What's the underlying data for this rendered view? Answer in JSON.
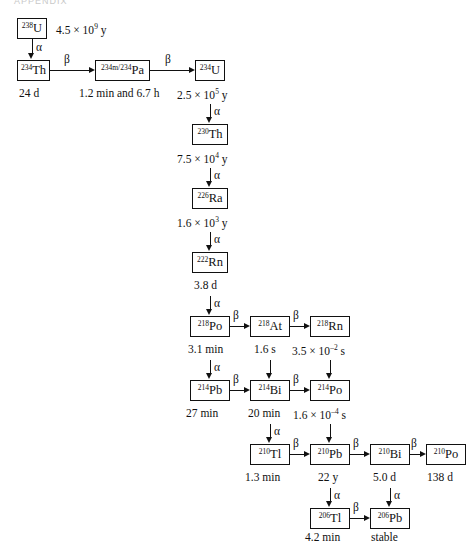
{
  "figure": {
    "title_fragment": "APPENDIX",
    "alpha_label": "α",
    "beta_label": "β"
  },
  "nuclides": [
    {
      "id": "u238",
      "mass": "238",
      "symbol": "U",
      "halflife": "4.5 × 10",
      "halflife_exp": "9",
      "halflife_unit": " y"
    },
    {
      "id": "th234",
      "mass": "234",
      "symbol": "Th",
      "halflife": "24 d",
      "halflife_exp": "",
      "halflife_unit": ""
    },
    {
      "id": "pa234",
      "mass": "234m/234",
      "symbol": "Pa",
      "halflife": "1.2 min and 6.7 h",
      "halflife_exp": "",
      "halflife_unit": ""
    },
    {
      "id": "u234",
      "mass": "234",
      "symbol": "U",
      "halflife": "2.5 × 10",
      "halflife_exp": "5",
      "halflife_unit": " y"
    },
    {
      "id": "th230",
      "mass": "230",
      "symbol": "Th",
      "halflife": "7.5 × 10",
      "halflife_exp": "4",
      "halflife_unit": " y"
    },
    {
      "id": "ra226",
      "mass": "226",
      "symbol": "Ra",
      "halflife": "1.6 × 10",
      "halflife_exp": "3",
      "halflife_unit": " y"
    },
    {
      "id": "rn222",
      "mass": "222",
      "symbol": "Rn",
      "halflife": "3.8 d",
      "halflife_exp": "",
      "halflife_unit": ""
    },
    {
      "id": "po218",
      "mass": "218",
      "symbol": "Po",
      "halflife": "3.1 min",
      "halflife_exp": "",
      "halflife_unit": ""
    },
    {
      "id": "at218",
      "mass": "218",
      "symbol": "At",
      "halflife": "1.6 s",
      "halflife_exp": "",
      "halflife_unit": ""
    },
    {
      "id": "rn218",
      "mass": "218",
      "symbol": "Rn",
      "halflife": "3.5 × 10",
      "halflife_exp": "–2",
      "halflife_unit": " s"
    },
    {
      "id": "pb214",
      "mass": "214",
      "symbol": "Pb",
      "halflife": "27 min",
      "halflife_exp": "",
      "halflife_unit": ""
    },
    {
      "id": "bi214",
      "mass": "214",
      "symbol": "Bi",
      "halflife": "20 min",
      "halflife_exp": "",
      "halflife_unit": ""
    },
    {
      "id": "po214",
      "mass": "214",
      "symbol": "Po",
      "halflife": "1.6 × 10",
      "halflife_exp": "–4",
      "halflife_unit": " s"
    },
    {
      "id": "tl210",
      "mass": "210",
      "symbol": "Tl",
      "halflife": "1.3 min",
      "halflife_exp": "",
      "halflife_unit": ""
    },
    {
      "id": "pb210",
      "mass": "210",
      "symbol": "Pb",
      "halflife": "22 y",
      "halflife_exp": "",
      "halflife_unit": ""
    },
    {
      "id": "bi210",
      "mass": "210",
      "symbol": "Bi",
      "halflife": "5.0 d",
      "halflife_exp": "",
      "halflife_unit": ""
    },
    {
      "id": "po210",
      "mass": "210",
      "symbol": "Po",
      "halflife": "138 d",
      "halflife_exp": "",
      "halflife_unit": ""
    },
    {
      "id": "tl206",
      "mass": "206",
      "symbol": "Tl",
      "halflife": "4.2 min",
      "halflife_exp": "",
      "halflife_unit": ""
    },
    {
      "id": "pb206",
      "mass": "206",
      "symbol": "Pb",
      "halflife": "stable",
      "halflife_exp": "",
      "halflife_unit": ""
    }
  ],
  "decays": [
    {
      "from": "u238",
      "to": "th234",
      "mode": "α"
    },
    {
      "from": "th234",
      "to": "pa234",
      "mode": "β"
    },
    {
      "from": "pa234",
      "to": "u234",
      "mode": "β"
    },
    {
      "from": "u234",
      "to": "th230",
      "mode": "α"
    },
    {
      "from": "th230",
      "to": "ra226",
      "mode": "α"
    },
    {
      "from": "ra226",
      "to": "rn222",
      "mode": "α"
    },
    {
      "from": "rn222",
      "to": "po218",
      "mode": "α"
    },
    {
      "from": "po218",
      "to": "at218",
      "mode": "β"
    },
    {
      "from": "at218",
      "to": "rn218",
      "mode": "β"
    },
    {
      "from": "po218",
      "to": "pb214",
      "mode": "α"
    },
    {
      "from": "at218",
      "to": "bi214",
      "mode": ""
    },
    {
      "from": "rn218",
      "to": "po214",
      "mode": ""
    },
    {
      "from": "pb214",
      "to": "bi214",
      "mode": "β"
    },
    {
      "from": "bi214",
      "to": "po214",
      "mode": "β"
    },
    {
      "from": "bi214",
      "to": "tl210",
      "mode": "α"
    },
    {
      "from": "po214",
      "to": "pb210",
      "mode": ""
    },
    {
      "from": "tl210",
      "to": "pb210",
      "mode": "β"
    },
    {
      "from": "pb210",
      "to": "bi210",
      "mode": "β"
    },
    {
      "from": "bi210",
      "to": "po210",
      "mode": "β"
    },
    {
      "from": "bi210",
      "to": "tl206",
      "mode": "α"
    },
    {
      "from": "po210",
      "to": "pb206",
      "mode": "α"
    },
    {
      "from": "tl206",
      "to": "pb206",
      "mode": "β"
    }
  ],
  "colors": {
    "ink": "#111111",
    "paper": "#ffffff"
  }
}
